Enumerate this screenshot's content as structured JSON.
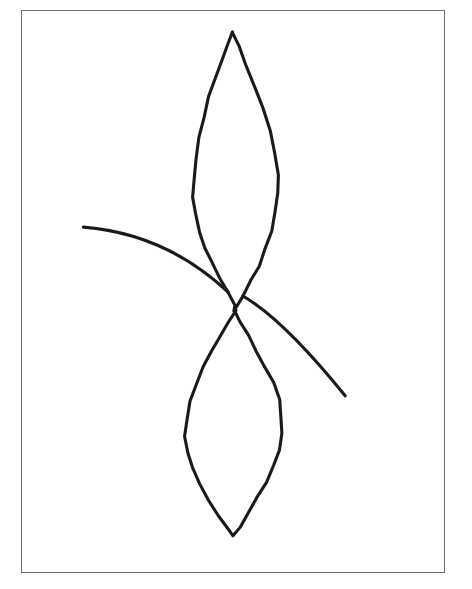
{
  "figure": {
    "kind": "line-drawing",
    "title": "",
    "background_color": "#ffffff",
    "ink_color": "#1a1a1a",
    "frame_color": "#6e6e6e",
    "frame": {
      "x": 21,
      "y": 10,
      "width": 424,
      "height": 563,
      "stroke_width": 1.4
    },
    "canvas": {
      "width": 472,
      "height": 589
    }
  },
  "chart_data": {
    "type": "line",
    "title": "",
    "subtitle": "",
    "xlabel": "",
    "ylabel": "",
    "grid": false,
    "legend": "none",
    "xlim": [
      21,
      445
    ],
    "ylim": [
      10,
      573
    ],
    "annotations": [],
    "features": [
      {
        "name": "saddle-point",
        "kind": "critical-point",
        "x": 235,
        "y": 310
      },
      {
        "name": "left-spiral-focus",
        "kind": "critical-point",
        "x": 123,
        "y": 315
      },
      {
        "name": "right-spiral-focus",
        "kind": "critical-point",
        "x": 335,
        "y": 305
      },
      {
        "name": "upper-lobe-tip",
        "kind": "cusp",
        "x": 233,
        "y": 32
      },
      {
        "name": "lower-lobe-tip",
        "kind": "cusp",
        "x": 233,
        "y": 537
      }
    ],
    "series": [
      {
        "name": "upper-lobe",
        "kind": "closed-loop",
        "stroke_width": 3.1,
        "points": [
          [
            233,
            32
          ],
          [
            228,
            45
          ],
          [
            222,
            60
          ],
          [
            215,
            78
          ],
          [
            209,
            96
          ],
          [
            203,
            116
          ],
          [
            198,
            137
          ],
          [
            195,
            158
          ],
          [
            193,
            178
          ],
          [
            193,
            196
          ],
          [
            195,
            214
          ],
          [
            199,
            231
          ],
          [
            205,
            247
          ],
          [
            212,
            263
          ],
          [
            220,
            278
          ],
          [
            228,
            292
          ],
          [
            235,
            305
          ],
          [
            235,
            310
          ],
          [
            243,
            296
          ],
          [
            251,
            281
          ],
          [
            259,
            265
          ],
          [
            266,
            248
          ],
          [
            272,
            230
          ],
          [
            276,
            212
          ],
          [
            278,
            193
          ],
          [
            278,
            174
          ],
          [
            275,
            153
          ],
          [
            270,
            131
          ],
          [
            263,
            109
          ],
          [
            255,
            88
          ],
          [
            246,
            64
          ],
          [
            238,
            45
          ],
          [
            233,
            32
          ]
        ]
      },
      {
        "name": "lower-lobe",
        "kind": "closed-loop",
        "stroke_width": 3.1,
        "points": [
          [
            235,
            310
          ],
          [
            228,
            323
          ],
          [
            220,
            337
          ],
          [
            211,
            352
          ],
          [
            203,
            368
          ],
          [
            196,
            385
          ],
          [
            190,
            402
          ],
          [
            186,
            420
          ],
          [
            185,
            437
          ],
          [
            187,
            453
          ],
          [
            192,
            468
          ],
          [
            200,
            484
          ],
          [
            209,
            500
          ],
          [
            219,
            516
          ],
          [
            228,
            529
          ],
          [
            233,
            537
          ],
          [
            240,
            527
          ],
          [
            249,
            513
          ],
          [
            258,
            498
          ],
          [
            266,
            483
          ],
          [
            273,
            467
          ],
          [
            279,
            450
          ],
          [
            282,
            433
          ],
          [
            282,
            416
          ],
          [
            279,
            399
          ],
          [
            273,
            382
          ],
          [
            265,
            366
          ],
          [
            256,
            350
          ],
          [
            248,
            335
          ],
          [
            241,
            322
          ],
          [
            235,
            310
          ]
        ]
      },
      {
        "name": "left-spiral",
        "kind": "spiral",
        "stroke_width": 3.1,
        "turns": 5.4,
        "direction": "counterclockwise-inward",
        "focus": [
          123,
          315
        ],
        "outer_start": [
          65,
          196
        ],
        "outer_end": [
          228,
          292
        ],
        "rx_outer": 92,
        "ry_outer": 98
      },
      {
        "name": "right-spiral",
        "kind": "spiral",
        "stroke_width": 3.1,
        "turns": 5.4,
        "direction": "clockwise-inward",
        "focus": [
          335,
          305
        ],
        "outer_start": [
          349,
          409
        ],
        "outer_end": [
          243,
          296
        ],
        "rx_outer": 80,
        "ry_outer": 92
      }
    ]
  }
}
